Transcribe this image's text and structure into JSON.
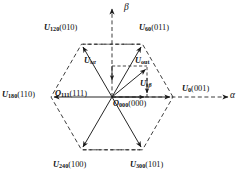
{
  "figure": {
    "type": "space-vector-hexagon-diagram",
    "axes": {
      "alpha": "α",
      "beta": "β"
    },
    "origin": {
      "x": 112,
      "y": 97
    },
    "radius": 61,
    "colors": {
      "stroke": "#1a1a1a",
      "dashed": "#1a1a1a",
      "background": "#ffffff",
      "text": "#111111"
    },
    "vectors": [
      {
        "id": "u0",
        "symbol": "U",
        "sub": "0",
        "bits": "(001)",
        "angle_deg": 0,
        "label": "U0(001)"
      },
      {
        "id": "u60",
        "symbol": "U",
        "sub": "60",
        "bits": "(011)",
        "angle_deg": 60,
        "label": "U60(011)"
      },
      {
        "id": "u120",
        "symbol": "U",
        "sub": "120",
        "bits": "(010)",
        "angle_deg": 120,
        "label": "U120(010)"
      },
      {
        "id": "u180",
        "symbol": "U",
        "sub": "180",
        "bits": "(110)",
        "angle_deg": 180,
        "label": "U180(110)"
      },
      {
        "id": "u240",
        "symbol": "U",
        "sub": "240",
        "bits": "(100)",
        "angle_deg": 240,
        "label": "U240(100)"
      },
      {
        "id": "u300",
        "symbol": "U",
        "sub": "300",
        "bits": "(101)",
        "angle_deg": 300,
        "label": "U300(101)"
      }
    ],
    "zero_vectors": [
      {
        "id": "o111",
        "symbol": "O",
        "sub": "111",
        "bits": "(111)",
        "label": "O111(111)"
      },
      {
        "id": "o000",
        "symbol": "O",
        "sub": "000",
        "bits": "(000)",
        "label": "O000(000)"
      }
    ],
    "reference": {
      "id": "uout",
      "symbol": "U",
      "sub": "out",
      "label": "Uout",
      "angle_deg": 40,
      "magnitude": 44
    },
    "components": [
      {
        "id": "usalpha",
        "symbol": "U",
        "sub": "sα",
        "label": "Usα",
        "axis": "alpha",
        "value": 34
      },
      {
        "id": "usbeta",
        "symbol": "U",
        "sub": "sβ",
        "label": "Usβ",
        "axis": "beta",
        "value": 28
      }
    ]
  }
}
